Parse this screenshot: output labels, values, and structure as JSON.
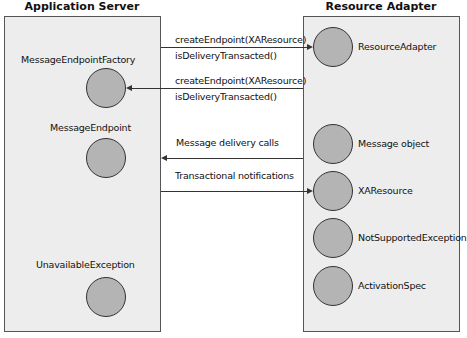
{
  "left_panel": {
    "title": "Application Server",
    "components": [
      {
        "label": "MessageEndpointFactory"
      },
      {
        "label": "MessageEndpoint"
      },
      {
        "label": "UnavailableException"
      }
    ]
  },
  "right_panel": {
    "title": "Resource Adapter",
    "components": [
      {
        "label": "ResourceAdapter"
      },
      {
        "label": "Message object"
      },
      {
        "label": "XAResource"
      },
      {
        "label": "NotSupportedException"
      },
      {
        "label": "ActivationSpec"
      }
    ]
  },
  "connections": [
    {
      "direction": "to-resource-adapter",
      "line1": "createEndpoint(XAResource)",
      "line2": "isDeliveryTransacted()"
    },
    {
      "direction": "to-application-server",
      "line1": "createEndpoint(XAResource)",
      "line2": "isDeliveryTransacted()"
    },
    {
      "direction": "to-application-server",
      "line1": "Message delivery calls"
    },
    {
      "direction": "to-resource-adapter",
      "line1": "Transactional notifications"
    }
  ]
}
